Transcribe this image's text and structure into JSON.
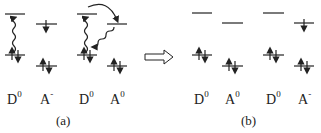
{
  "panels": [
    {
      "caption": "(a)",
      "species": [
        {
          "base": "D",
          "sup": "0"
        },
        {
          "base": "A",
          "sup": "-"
        },
        {
          "base": "D",
          "sup": "0"
        },
        {
          "base": "A",
          "sup": "0"
        }
      ],
      "annotations": [
        "excitation (wavy arrow up)",
        "electron transfer (curved arrow)",
        "relaxation (wavy arrow down)"
      ]
    },
    {
      "caption": "(b)",
      "species": [
        {
          "base": "D",
          "sup": "0"
        },
        {
          "base": "A",
          "sup": "0"
        },
        {
          "base": "D",
          "sup": "0"
        },
        {
          "base": "A",
          "sup": "-"
        }
      ]
    }
  ],
  "transition_arrow": "hollow-right-arrow",
  "colors": {
    "ink": "#222222",
    "background": "#ffffff"
  }
}
